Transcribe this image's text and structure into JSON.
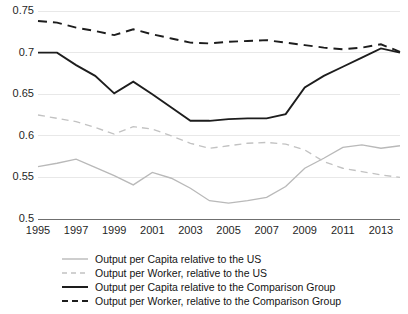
{
  "chart_data": {
    "type": "line",
    "title": "",
    "subtitle": "",
    "xlabel": "",
    "ylabel": "",
    "xlim": [
      1995,
      2014
    ],
    "ylim": [
      0.5,
      0.75
    ],
    "yticks": [
      0.5,
      0.55,
      0.6,
      0.65,
      0.7,
      0.75
    ],
    "ytick_labels": [
      "0.5",
      "0.55",
      "0.6",
      "0.65",
      "0.7",
      "0.75"
    ],
    "xticks": [
      1995,
      1997,
      1999,
      2001,
      2003,
      2005,
      2007,
      2009,
      2011,
      2013
    ],
    "xtick_labels": [
      "1995",
      "1997",
      "1999",
      "2001",
      "2003",
      "2005",
      "2007",
      "2009",
      "2011",
      "2013"
    ],
    "grid": true,
    "legend_position": "below",
    "x": [
      1995,
      1996,
      1997,
      1998,
      1999,
      2000,
      2001,
      2002,
      2003,
      2004,
      2005,
      2006,
      2007,
      2008,
      2009,
      2010,
      2011,
      2012,
      2013,
      2014
    ],
    "series": [
      {
        "name": "Output per Capita relative to the US",
        "style": "solid",
        "color": "#b9b9b9",
        "values": [
          0.563,
          0.567,
          0.572,
          0.562,
          0.552,
          0.541,
          0.556,
          0.549,
          0.537,
          0.522,
          0.519,
          0.522,
          0.526,
          0.539,
          0.561,
          0.573,
          0.586,
          0.589,
          0.585,
          0.588
        ]
      },
      {
        "name": "Output per Worker, relative to the US",
        "style": "dashed",
        "color": "#c2c2c2",
        "values": [
          0.625,
          0.621,
          0.617,
          0.61,
          0.602,
          0.611,
          0.608,
          0.6,
          0.591,
          0.585,
          0.588,
          0.591,
          0.592,
          0.59,
          0.583,
          0.569,
          0.561,
          0.557,
          0.553,
          0.55
        ]
      },
      {
        "name": "Output per Capita relative to the Comparison Group",
        "style": "solid",
        "color": "#1d1d1d",
        "values": [
          0.7,
          0.7,
          0.685,
          0.672,
          0.651,
          0.665,
          0.65,
          0.634,
          0.618,
          0.618,
          0.62,
          0.621,
          0.621,
          0.626,
          0.658,
          0.672,
          0.683,
          0.694,
          0.705,
          0.7
        ]
      },
      {
        "name": "Output per Worker, relative to the Comparison Group",
        "style": "dashed",
        "color": "#1d1d1d",
        "values": [
          0.738,
          0.736,
          0.73,
          0.726,
          0.721,
          0.728,
          0.722,
          0.717,
          0.712,
          0.711,
          0.713,
          0.714,
          0.715,
          0.712,
          0.709,
          0.706,
          0.704,
          0.706,
          0.71,
          0.701
        ]
      }
    ]
  },
  "legend": {
    "items": [
      {
        "label": "Output per Capita relative to the US",
        "key": "line-key-solid-light"
      },
      {
        "label": "Output per Worker, relative to the US",
        "key": "line-key-dashed-light"
      },
      {
        "label": "Output per Capita relative to the Comparison Group",
        "key": "line-key-solid-dark"
      },
      {
        "label": "Output per Worker, relative to the Comparison Group",
        "key": "line-key-dashed-dark"
      }
    ]
  }
}
